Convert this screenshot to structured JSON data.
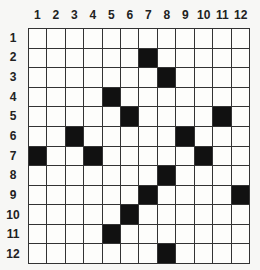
{
  "puzzle": {
    "rows": 12,
    "cols": 12,
    "col_labels": [
      "1",
      "2",
      "3",
      "4",
      "5",
      "6",
      "7",
      "8",
      "9",
      "10",
      "11",
      "12"
    ],
    "row_labels": [
      "1",
      "2",
      "3",
      "4",
      "5",
      "6",
      "7",
      "8",
      "9",
      "10",
      "11",
      "12"
    ],
    "black_cells": [
      [
        2,
        7
      ],
      [
        3,
        8
      ],
      [
        4,
        5
      ],
      [
        5,
        6
      ],
      [
        5,
        11
      ],
      [
        6,
        3
      ],
      [
        6,
        9
      ],
      [
        7,
        1
      ],
      [
        7,
        4
      ],
      [
        7,
        10
      ],
      [
        8,
        8
      ],
      [
        9,
        7
      ],
      [
        9,
        12
      ],
      [
        10,
        6
      ],
      [
        11,
        5
      ],
      [
        12,
        8
      ]
    ],
    "colors": {
      "black": "#111111",
      "white": "#fdfdfb",
      "grid_line": "#333333"
    }
  }
}
